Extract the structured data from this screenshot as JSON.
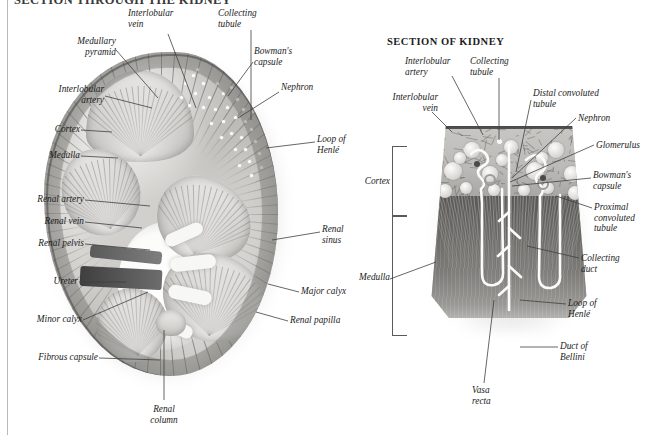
{
  "page": {
    "header_title": "SECTION THROUGH THE KIDNEY",
    "background_color": "#ffffff",
    "ink_color": "#1b1b1b",
    "leader_color": "#404040"
  },
  "left_figure": {
    "title": "",
    "labels": [
      {
        "id": "medullary-pyramid",
        "text": "Medullary\npyramid"
      },
      {
        "id": "interlobular-vein",
        "text": "Interlobular\nvein"
      },
      {
        "id": "collecting-tubule",
        "text": "Collecting\ntubule"
      },
      {
        "id": "bowmans-capsule",
        "text": "Bowman's\ncapsule"
      },
      {
        "id": "interlobular-artery",
        "text": "Interlobular\nartery"
      },
      {
        "id": "nephron",
        "text": "Nephron"
      },
      {
        "id": "cortex",
        "text": "Cortex"
      },
      {
        "id": "medulla",
        "text": "Medulla"
      },
      {
        "id": "loop-of-henle",
        "text": "Loop of\nHenlé"
      },
      {
        "id": "renal-artery",
        "text": "Renal artery"
      },
      {
        "id": "renal-vein",
        "text": "Renal vein"
      },
      {
        "id": "renal-pelvis",
        "text": "Renal pelvis"
      },
      {
        "id": "renal-sinus",
        "text": "Renal\nsinus"
      },
      {
        "id": "ureter",
        "text": "Ureter"
      },
      {
        "id": "major-calyx",
        "text": "Major calyx"
      },
      {
        "id": "minor-calyx",
        "text": "Minor calyx"
      },
      {
        "id": "renal-papilla",
        "text": "Renal papilla"
      },
      {
        "id": "fibrous-capsule",
        "text": "Fibrous capsule"
      },
      {
        "id": "renal-column",
        "text": "Renal\ncolumn"
      }
    ]
  },
  "right_figure": {
    "title": "SECTION OF KIDNEY",
    "labels": [
      {
        "id": "interlobular-artery",
        "text": "Interlobular\nartery"
      },
      {
        "id": "collecting-tubule",
        "text": "Collecting\ntubule"
      },
      {
        "id": "distal-convoluted-tubule",
        "text": "Distal convoluted\ntubule"
      },
      {
        "id": "nephron",
        "text": "Nephron"
      },
      {
        "id": "glomerulus",
        "text": "Glomerulus"
      },
      {
        "id": "interlobular-vein",
        "text": "Interlobular\nvein"
      },
      {
        "id": "bowmans-capsule",
        "text": "Bowman's\ncapsule"
      },
      {
        "id": "cortex",
        "text": "Cortex"
      },
      {
        "id": "proximal-convoluted-tubule",
        "text": "Proximal\nconvoluted\ntubule"
      },
      {
        "id": "collecting-duct",
        "text": "Collecting\nduct"
      },
      {
        "id": "medulla",
        "text": "Medulla"
      },
      {
        "id": "loop-of-henle",
        "text": "Loop of\nHenlé"
      },
      {
        "id": "duct-of-bellini",
        "text": "Duct of\nBellini"
      },
      {
        "id": "vasa-recta",
        "text": "Vasa\nrecta"
      }
    ]
  }
}
